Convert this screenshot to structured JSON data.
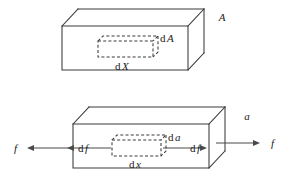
{
  "figure": {
    "name": "differential-element-in-bar-diagram",
    "background_color": "#ffffff",
    "line_color": "#3a3a3a",
    "arrow_color": "#4a4a4a",
    "text_color": "#1a1a1a",
    "width": 287,
    "height": 180
  },
  "top_diagram": {
    "name": "upper-bar",
    "area_label": "A",
    "element_area_label_d": "d",
    "element_area_label_var": "A",
    "element_length_label_d": "d",
    "element_length_label_var": "X",
    "element_area_label": "dA",
    "element_length_label": "dX"
  },
  "bottom_diagram": {
    "name": "lower-bar",
    "area_label": "a",
    "element_area_label_d": "d",
    "element_area_label_var": "a",
    "element_length_label_d": "d",
    "element_length_label_var": "x",
    "element_area_label": "da",
    "element_length_label": "dx",
    "force_left_outer": "f",
    "force_left_inner_d": "d",
    "force_left_inner_var": "f",
    "force_right_inner_d": "d",
    "force_right_inner_var": "f",
    "force_right_outer": "f",
    "force_left_inner": "df",
    "force_right_inner": "df"
  }
}
